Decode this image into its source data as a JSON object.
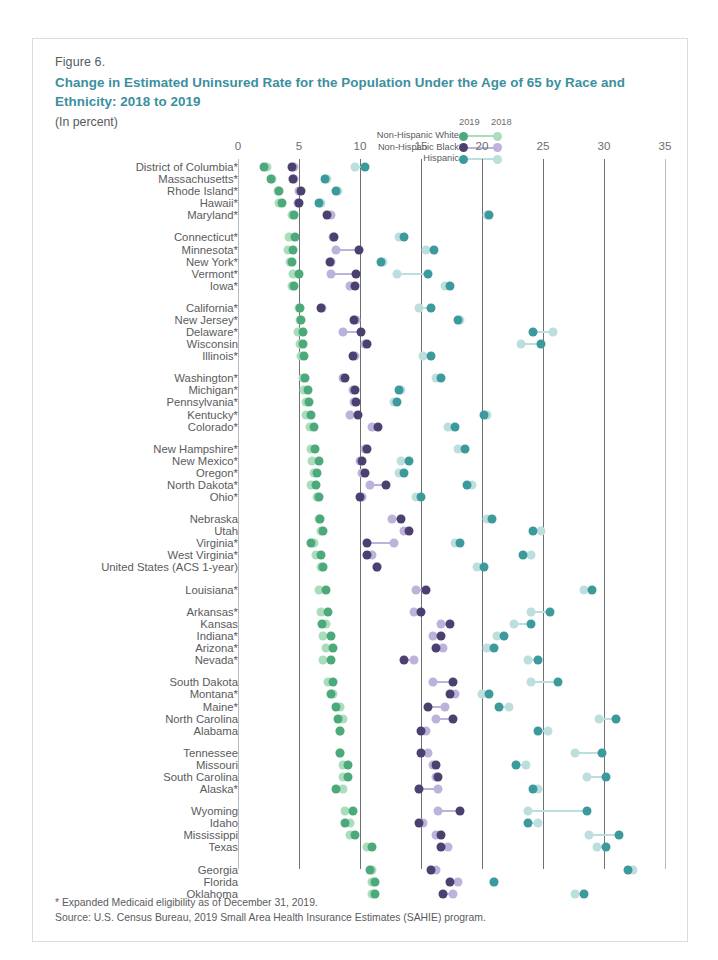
{
  "figure": {
    "number": "Figure 6.",
    "title": "Change in Estimated Uninsured Rate for the Population Under the Age of 65 by Race and Ethnicity: 2018 to 2019",
    "subtitle": "(In percent)",
    "footnote": "* Expanded Medicaid eligibility as of December 31, 2019.",
    "source": "Source: U.S. Census Bureau, 2019 Small Area Health Insurance Estimates (SAHIE) program.",
    "title_color": "#3c8f9e"
  },
  "legend": {
    "year_new": "2019",
    "year_old": "2018",
    "entries": [
      {
        "label": "Non-Hispanic White",
        "color_new": "#4ba97a",
        "color_old": "#a9ddbb"
      },
      {
        "label": "Non-Hispanic Black",
        "color_new": "#4c4070",
        "color_old": "#bdb2da"
      },
      {
        "label": "Hispanic",
        "color_new": "#3d9a9c",
        "color_old": "#bcdedd"
      }
    ]
  },
  "chart_data": {
    "type": "scatter",
    "title": "Change in Estimated Uninsured Rate for the Population Under the Age of 65 by Race and Ethnicity: 2018 to 2019",
    "xlabel": "",
    "ylabel": "",
    "xlim": [
      0,
      35
    ],
    "xticks": [
      0,
      5,
      10,
      15,
      20,
      25,
      30,
      35
    ],
    "grid": true,
    "legend_position": "top-right",
    "series_names": [
      "Non-Hispanic White 2019",
      "Non-Hispanic White 2018",
      "Non-Hispanic Black 2019",
      "Non-Hispanic Black 2018",
      "Hispanic 2019",
      "Hispanic 2018"
    ],
    "rows": [
      {
        "state": "District of Columbia*",
        "white_2019": 2.1,
        "white_2018": 2.4,
        "black_2019": 4.4,
        "black_2018": 4.6,
        "hispanic_2019": 10.4,
        "hispanic_2018": 9.6
      },
      {
        "state": "Massachusetts*",
        "white_2019": 2.7,
        "white_2018": 2.8,
        "black_2019": 4.5,
        "black_2018": 4.6,
        "hispanic_2019": 7.1,
        "hispanic_2018": 7.3
      },
      {
        "state": "Rhode Island*",
        "white_2019": 3.4,
        "white_2018": 3.3,
        "black_2019": 5.2,
        "black_2018": 5.0,
        "hispanic_2019": 8.0,
        "hispanic_2018": 8.2
      },
      {
        "state": "Hawaii*",
        "white_2019": 3.6,
        "white_2018": 3.4,
        "black_2019": 5.0,
        "black_2018": 4.9,
        "hispanic_2019": 6.6,
        "hispanic_2018": 6.8
      },
      {
        "state": "Maryland*",
        "white_2019": 4.6,
        "white_2018": 4.4,
        "black_2019": 7.3,
        "black_2018": 7.6,
        "hispanic_2019": 20.6,
        "hispanic_2018": 20.4
      },
      {
        "state": "Connecticut*",
        "white_2019": 4.7,
        "white_2018": 4.2,
        "black_2019": 7.9,
        "black_2018": 7.8,
        "hispanic_2019": 13.6,
        "hispanic_2018": 13.2
      },
      {
        "state": "Minnesota*",
        "white_2019": 4.5,
        "white_2018": 4.1,
        "black_2019": 9.9,
        "black_2018": 8.0,
        "hispanic_2019": 16.1,
        "hispanic_2018": 15.4
      },
      {
        "state": "New York*",
        "white_2019": 4.4,
        "white_2018": 4.3,
        "black_2019": 7.5,
        "black_2018": 7.6,
        "hispanic_2019": 11.7,
        "hispanic_2018": 11.9
      },
      {
        "state": "Vermont*",
        "white_2019": 5.0,
        "white_2018": 4.5,
        "black_2019": 9.7,
        "black_2018": 7.6,
        "hispanic_2019": 15.6,
        "hispanic_2018": 13.0
      },
      {
        "state": "Iowa*",
        "white_2019": 4.6,
        "white_2018": 4.4,
        "black_2019": 9.6,
        "black_2018": 9.2,
        "hispanic_2019": 17.4,
        "hispanic_2018": 17.0
      },
      {
        "state": "California*",
        "white_2019": 5.1,
        "white_2018": 5.0,
        "black_2019": 6.8,
        "black_2018": 6.9,
        "hispanic_2019": 15.8,
        "hispanic_2018": 14.8
      },
      {
        "state": "New Jersey*",
        "white_2019": 5.2,
        "white_2018": 5.1,
        "black_2019": 9.5,
        "black_2018": 9.7,
        "hispanic_2019": 18.0,
        "hispanic_2018": 18.2
      },
      {
        "state": "Delaware*",
        "white_2019": 5.3,
        "white_2018": 4.9,
        "black_2019": 10.1,
        "black_2018": 8.6,
        "hispanic_2019": 24.2,
        "hispanic_2018": 25.8
      },
      {
        "state": "Wisconsin",
        "white_2019": 5.3,
        "white_2018": 5.1,
        "black_2019": 10.6,
        "black_2018": 10.4,
        "hispanic_2019": 24.8,
        "hispanic_2018": 23.2
      },
      {
        "state": "Illinois*",
        "white_2019": 5.4,
        "white_2018": 5.2,
        "black_2019": 9.4,
        "black_2018": 9.6,
        "hispanic_2019": 15.8,
        "hispanic_2018": 15.2
      },
      {
        "state": "Washington*",
        "white_2019": 5.5,
        "white_2018": 5.3,
        "black_2019": 8.8,
        "black_2018": 8.6,
        "hispanic_2019": 16.6,
        "hispanic_2018": 16.2
      },
      {
        "state": "Michigan*",
        "white_2019": 5.7,
        "white_2018": 5.4,
        "black_2019": 9.6,
        "black_2018": 9.4,
        "hispanic_2019": 13.2,
        "hispanic_2018": 13.4
      },
      {
        "state": "Pennsylvania*",
        "white_2019": 5.8,
        "white_2018": 5.6,
        "black_2019": 9.7,
        "black_2018": 9.5,
        "hispanic_2019": 13.0,
        "hispanic_2018": 12.8
      },
      {
        "state": "Kentucky*",
        "white_2019": 6.0,
        "white_2018": 5.6,
        "black_2019": 9.8,
        "black_2018": 9.2,
        "hispanic_2019": 20.2,
        "hispanic_2018": 20.4
      },
      {
        "state": "Colorado*",
        "white_2019": 6.2,
        "white_2018": 5.9,
        "black_2019": 11.5,
        "black_2018": 11.0,
        "hispanic_2019": 17.8,
        "hispanic_2018": 17.2
      },
      {
        "state": "New Hampshire*",
        "white_2019": 6.3,
        "white_2018": 6.0,
        "black_2019": 10.6,
        "black_2018": 10.4,
        "hispanic_2019": 18.6,
        "hispanic_2018": 18.0
      },
      {
        "state": "New Mexico*",
        "white_2019": 6.6,
        "white_2018": 6.1,
        "black_2019": 10.2,
        "black_2018": 10.0,
        "hispanic_2019": 14.0,
        "hispanic_2018": 13.4
      },
      {
        "state": "Oregon*",
        "white_2019": 6.5,
        "white_2018": 6.2,
        "black_2019": 10.4,
        "black_2018": 10.2,
        "hispanic_2019": 13.6,
        "hispanic_2018": 13.2
      },
      {
        "state": "North Dakota*",
        "white_2019": 6.4,
        "white_2018": 6.0,
        "black_2019": 12.1,
        "black_2018": 10.8,
        "hispanic_2019": 18.8,
        "hispanic_2018": 19.2
      },
      {
        "state": "Ohio*",
        "white_2019": 6.6,
        "white_2018": 6.5,
        "black_2019": 10.0,
        "black_2018": 10.2,
        "hispanic_2019": 15.0,
        "hispanic_2018": 14.6
      },
      {
        "state": "Nebraska",
        "white_2019": 6.7,
        "white_2018": 6.6,
        "black_2019": 13.4,
        "black_2018": 12.6,
        "hispanic_2019": 20.8,
        "hispanic_2018": 20.4
      },
      {
        "state": "Utah",
        "white_2019": 7.0,
        "white_2018": 6.8,
        "black_2019": 14.0,
        "black_2018": 13.6,
        "hispanic_2019": 24.2,
        "hispanic_2018": 24.8
      },
      {
        "state": "Virginia*",
        "white_2019": 6.0,
        "white_2018": 6.2,
        "black_2019": 10.6,
        "black_2018": 12.8,
        "hispanic_2019": 18.2,
        "hispanic_2018": 17.8
      },
      {
        "state": "West Virginia*",
        "white_2019": 6.8,
        "white_2018": 6.4,
        "black_2019": 10.6,
        "black_2018": 11.0,
        "hispanic_2019": 23.4,
        "hispanic_2018": 24.0
      },
      {
        "state": "United States (ACS 1-year)",
        "white_2019": 7.0,
        "white_2018": 6.8,
        "black_2019": 11.4,
        "black_2018": 11.4,
        "hispanic_2019": 20.2,
        "hispanic_2018": 19.6
      },
      {
        "state": "Louisiana*",
        "white_2019": 7.2,
        "white_2018": 6.6,
        "black_2019": 15.4,
        "black_2018": 14.6,
        "hispanic_2019": 29.0,
        "hispanic_2018": 28.4
      },
      {
        "state": "Arkansas*",
        "white_2019": 7.4,
        "white_2018": 6.8,
        "black_2019": 15.0,
        "black_2018": 14.4,
        "hispanic_2019": 25.6,
        "hispanic_2018": 24.0
      },
      {
        "state": "Kansas",
        "white_2019": 6.9,
        "white_2018": 7.2,
        "black_2019": 17.4,
        "black_2018": 16.6,
        "hispanic_2019": 24.0,
        "hispanic_2018": 22.6
      },
      {
        "state": "Indiana*",
        "white_2019": 7.6,
        "white_2018": 7.0,
        "black_2019": 16.6,
        "black_2018": 16.0,
        "hispanic_2019": 21.8,
        "hispanic_2018": 21.2
      },
      {
        "state": "Arizona*",
        "white_2019": 7.8,
        "white_2018": 7.2,
        "black_2019": 16.2,
        "black_2018": 16.8,
        "hispanic_2019": 21.0,
        "hispanic_2018": 20.4
      },
      {
        "state": "Nevada*",
        "white_2019": 7.6,
        "white_2018": 7.0,
        "black_2019": 13.6,
        "black_2018": 14.4,
        "hispanic_2019": 24.6,
        "hispanic_2018": 23.8
      },
      {
        "state": "South Dakota",
        "white_2019": 7.8,
        "white_2018": 7.4,
        "black_2019": 17.6,
        "black_2018": 16.0,
        "hispanic_2019": 26.2,
        "hispanic_2018": 24.0
      },
      {
        "state": "Montana*",
        "white_2019": 7.6,
        "white_2018": 7.8,
        "black_2019": 17.4,
        "black_2018": 17.8,
        "hispanic_2019": 20.6,
        "hispanic_2018": 20.0
      },
      {
        "state": "Maine*",
        "white_2019": 8.0,
        "white_2018": 8.4,
        "black_2019": 15.6,
        "black_2018": 17.0,
        "hispanic_2019": 21.4,
        "hispanic_2018": 22.2
      },
      {
        "state": "North Carolina",
        "white_2019": 8.2,
        "white_2018": 8.6,
        "black_2019": 17.6,
        "black_2018": 16.2,
        "hispanic_2019": 31.0,
        "hispanic_2018": 29.6
      },
      {
        "state": "Alabama",
        "white_2019": 8.4,
        "white_2018": 8.4,
        "black_2019": 15.0,
        "black_2018": 15.4,
        "hispanic_2019": 24.6,
        "hispanic_2018": 25.4
      },
      {
        "state": "Tennessee",
        "white_2019": 8.4,
        "white_2018": 8.4,
        "black_2019": 15.0,
        "black_2018": 15.6,
        "hispanic_2019": 29.8,
        "hispanic_2018": 27.6
      },
      {
        "state": "Missouri",
        "white_2019": 9.0,
        "white_2018": 8.6,
        "black_2019": 16.2,
        "black_2018": 16.0,
        "hispanic_2019": 22.8,
        "hispanic_2018": 23.6
      },
      {
        "state": "South Carolina",
        "white_2019": 9.0,
        "white_2018": 8.6,
        "black_2019": 16.4,
        "black_2018": 16.2,
        "hispanic_2019": 30.2,
        "hispanic_2018": 28.6
      },
      {
        "state": "Alaska*",
        "white_2019": 8.0,
        "white_2018": 8.6,
        "black_2019": 14.8,
        "black_2018": 16.4,
        "hispanic_2019": 24.2,
        "hispanic_2018": 24.6
      },
      {
        "state": "Wyoming",
        "white_2019": 9.4,
        "white_2018": 8.8,
        "black_2019": 18.2,
        "black_2018": 16.4,
        "hispanic_2019": 28.6,
        "hispanic_2018": 23.8
      },
      {
        "state": "Idaho",
        "white_2019": 8.8,
        "white_2018": 9.2,
        "black_2019": 14.8,
        "black_2018": 15.2,
        "hispanic_2019": 23.8,
        "hispanic_2018": 24.6
      },
      {
        "state": "Mississippi",
        "white_2019": 9.6,
        "white_2018": 9.2,
        "black_2019": 16.6,
        "black_2018": 16.2,
        "hispanic_2019": 31.2,
        "hispanic_2018": 28.8
      },
      {
        "state": "Texas",
        "white_2019": 11.0,
        "white_2018": 10.6,
        "black_2019": 16.6,
        "black_2018": 17.2,
        "hispanic_2019": 30.2,
        "hispanic_2018": 29.4
      },
      {
        "state": "Georgia",
        "white_2019": 10.8,
        "white_2018": 11.0,
        "black_2019": 15.8,
        "black_2018": 16.2,
        "hispanic_2019": 32.0,
        "hispanic_2018": 32.4
      },
      {
        "state": "Florida",
        "white_2019": 11.2,
        "white_2018": 11.0,
        "black_2019": 17.4,
        "black_2018": 18.0,
        "hispanic_2019": 21.0,
        "hispanic_2018": 21.0
      },
      {
        "state": "Oklahoma",
        "white_2019": 11.2,
        "white_2018": 11.0,
        "black_2019": 16.8,
        "black_2018": 17.6,
        "hispanic_2019": 28.4,
        "hispanic_2018": 27.6
      }
    ],
    "group_breaks": [
      4,
      9,
      14,
      19,
      24,
      29,
      30,
      35,
      40,
      44,
      48
    ]
  }
}
